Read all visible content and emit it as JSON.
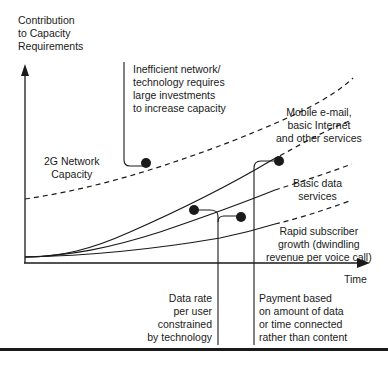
{
  "axes": {
    "y_label": [
      "Contribution",
      "to Capacity",
      "Requirements"
    ],
    "x_label": "Time"
  },
  "curves": {
    "capacity": "2G Network Capacity",
    "rapid_subscriber": "Rapid subscriber growth (dwindling revenue per voice call)",
    "basic_data": "Basic data services",
    "mobile_email": "Mobile e-mail, basic Internet and other services"
  },
  "labels": {
    "capacity": [
      "2G Network",
      "Capacity"
    ],
    "inefficient": [
      "Inefficient network/",
      "technology requires",
      "large investments",
      "to increase capacity"
    ],
    "mobile": [
      "Mobile e-mail,",
      "basic Internet",
      "and other services"
    ],
    "basic_data": [
      "Basic data",
      "services"
    ],
    "rapid": [
      "Rapid subscriber",
      "growth (dwindling",
      "revenue per voice call)"
    ],
    "data_rate": [
      "Data rate",
      "per user",
      "constrained",
      "by technology"
    ],
    "payment": [
      "Payment based",
      "on amount of data",
      "or time connected",
      "rather than content"
    ]
  },
  "colors": {
    "ink": "#1a1a1a",
    "background": "#ffffff"
  }
}
